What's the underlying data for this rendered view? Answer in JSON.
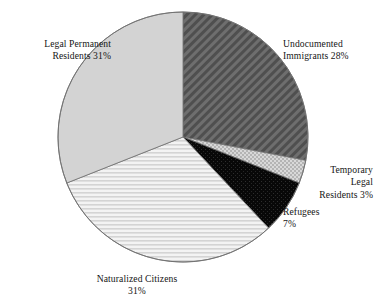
{
  "chart_data": {
    "type": "pie",
    "title": "",
    "subtitle": "",
    "xlabel": "",
    "ylabel": "",
    "grid": false,
    "legend_position": "outside-callout-labels",
    "units": "percent",
    "start_angle_deg": 0,
    "direction": "clockwise",
    "center": {
      "x": 183,
      "y": 137
    },
    "radius": 125,
    "categories": [
      "Undocumented Immigrants",
      "Temporary Legal Residents",
      "Refugees",
      "Naturalized Citizens",
      "Legal Permanent Residents"
    ],
    "values": [
      28,
      3,
      7,
      31,
      31
    ],
    "slices": [
      {
        "name": "Undocumented Immigrants",
        "value": 28,
        "value_text": "28%",
        "fill": "#555555",
        "pattern": "diagonal-hatch",
        "start_deg": 0,
        "end_deg": 100.8
      },
      {
        "name": "Temporary Legal Residents",
        "value": 3,
        "value_text": "3%",
        "fill": "#c9c9c9",
        "pattern": "checker-dot",
        "start_deg": 100.8,
        "end_deg": 111.6
      },
      {
        "name": "Refugees",
        "value": 7,
        "value_text": "7%",
        "fill": "#0a0a0a",
        "pattern": "dark-dot",
        "start_deg": 111.6,
        "end_deg": 136.8
      },
      {
        "name": "Naturalized Citizens",
        "value": 31,
        "value_text": "31%",
        "fill": "#e8e8e8",
        "pattern": "horizontal-lines",
        "start_deg": 136.8,
        "end_deg": 248.4
      },
      {
        "name": "Legal Permanent Residents",
        "value": 31,
        "value_text": "31%",
        "fill": "#d2d2d2",
        "pattern": "solid",
        "start_deg": 248.4,
        "end_deg": 360
      }
    ]
  },
  "labels": {
    "legal_permanent": "Legal Permanent\nResidents 31%",
    "undocumented": "Undocumented\nImmigrants 28%",
    "temporary": "Temporary\nLegal\nResidents 3%",
    "refugees": "Refugees\n7%",
    "naturalized": "Naturalized Citizens\n31%"
  },
  "colors": {
    "outline": "#6f6f6f",
    "background": "#ffffff",
    "text": "#151515"
  }
}
